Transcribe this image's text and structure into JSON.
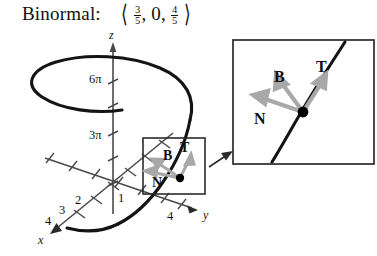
{
  "caption": {
    "label": "Binormal:",
    "vector": {
      "open": "⟨",
      "close": "⟩",
      "components": [
        {
          "type": "fraction",
          "numerator": "3",
          "denominator": "5"
        },
        {
          "type": "integer",
          "value": "0"
        },
        {
          "type": "fraction",
          "numerator": "4",
          "denominator": "5"
        }
      ],
      "separator": ","
    },
    "plain_text": "Binormal: ⟨3/5, 0, 4/5⟩"
  },
  "figure": {
    "type": "3d-helix-tnb-frame-diagram",
    "axes": {
      "z": {
        "label": "z",
        "tick_labels": [
          "6π",
          "3π"
        ]
      },
      "y": {
        "label": "y",
        "tick_labels": [
          "4"
        ]
      },
      "x": {
        "label": "x",
        "tick_labels": [
          "1",
          "2",
          "3",
          "4"
        ]
      }
    },
    "vectors": {
      "tangent": "T",
      "binormal": "B",
      "normal": "N"
    },
    "colors": {
      "curve": "#141414",
      "axis": "#3d3d3d",
      "vector_arrow": "#a8a8a8",
      "point": "#000000",
      "box_border": "#2b2b2b",
      "background": "#ffffff"
    }
  },
  "inset": {
    "name": "magnified-detail-view",
    "vectors": {
      "tangent": "T",
      "binormal": "B",
      "normal": "N"
    }
  }
}
